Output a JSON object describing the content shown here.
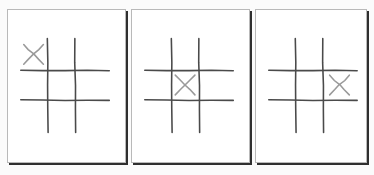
{
  "scene": {
    "title": "Tic Tac Toe Grid Sequence",
    "background_color": "#fbfbfb",
    "panel_count": 3,
    "description": "Three hand-drawn tic tac toe boards shown side by side, each with a single X mark placed in a different cell."
  },
  "style": {
    "panel_fill": "#ffffff",
    "panel_border_color": "#b9b9b9",
    "panel_shadow_color": "#2f2f2f",
    "grid_line_color": "#4a4a4a",
    "mark_color": "#9a9a9a",
    "grid_line_width": 1.6,
    "mark_line_width": 1.6
  },
  "board_geometry": {
    "vertical_line_x": [
      40,
      68
    ],
    "vertical_line_y_start": 29,
    "vertical_line_y_end": 124,
    "horizontal_line_y": [
      61,
      91
    ],
    "horizontal_line_x_start": 13,
    "horizontal_line_x_end": 103,
    "cell_centers": {
      "top-left": [
        26,
        45
      ],
      "top-center": [
        54,
        45
      ],
      "top-right": [
        85,
        45
      ],
      "middle-left": [
        26,
        76
      ],
      "center": [
        54,
        76
      ],
      "middle-right": [
        85,
        76
      ],
      "bottom-left": [
        26,
        107
      ],
      "bottom-center": [
        54,
        107
      ],
      "bottom-right": [
        85,
        107
      ]
    },
    "mark_half_size": 10
  },
  "panels": [
    {
      "id": "panel-1",
      "label": "Board 1",
      "order": 1,
      "x": 7,
      "y": 9,
      "width": 119,
      "height": 154,
      "marks": [
        {
          "player": "X",
          "cell": "top-left",
          "row": 0,
          "col": 0
        }
      ],
      "mark_summary": "X in top-left"
    },
    {
      "id": "panel-2",
      "label": "Board 2",
      "order": 2,
      "x": 131,
      "y": 9,
      "width": 119,
      "height": 154,
      "marks": [
        {
          "player": "X",
          "cell": "center",
          "row": 1,
          "col": 1
        }
      ],
      "mark_summary": "X in center"
    },
    {
      "id": "panel-3",
      "label": "Board 3",
      "order": 3,
      "x": 255,
      "y": 9,
      "width": 112,
      "height": 154,
      "marks": [
        {
          "player": "X",
          "cell": "middle-right",
          "row": 1,
          "col": 2
        }
      ],
      "mark_summary": "X in middle-right"
    }
  ]
}
